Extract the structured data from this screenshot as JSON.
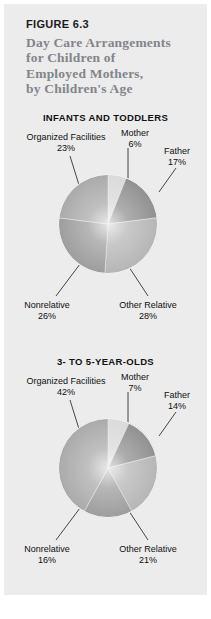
{
  "figure": {
    "number": "FIGURE 6.3",
    "title_lines": [
      "Day Care Arrangements",
      "for Children of",
      "Employed Mothers,",
      "by Children's Age"
    ],
    "title_color": "#82858a",
    "number_color": "#1b1b1b",
    "panel_color": "#ececed"
  },
  "chart_data": [
    {
      "type": "pie",
      "title": "INFANTS AND TODDLERS",
      "categories": [
        "Mother",
        "Father",
        "Other Relative",
        "Nonrelative",
        "Organized Facilities"
      ],
      "values": [
        6,
        17,
        28,
        26,
        23
      ],
      "labels": [
        "6%",
        "17%",
        "28%",
        "26%",
        "23%"
      ],
      "slice_colors": [
        "#d9d9d9",
        "#8e8e8e",
        "#b4b4b4",
        "#9b9b9b",
        "#a8a8a8"
      ],
      "start_angle": 0,
      "direction": "clockwise",
      "legend": "none",
      "grid": false
    },
    {
      "type": "pie",
      "title": "3- TO 5-YEAR-OLDS",
      "categories": [
        "Mother",
        "Father",
        "Other Relative",
        "Nonrelative",
        "Organized Facilities"
      ],
      "values": [
        7,
        14,
        21,
        16,
        42
      ],
      "labels": [
        "7%",
        "14%",
        "21%",
        "16%",
        "42%"
      ],
      "slice_colors": [
        "#d9d9d9",
        "#8e8e8e",
        "#b4b4b4",
        "#9b9b9b",
        "#a8a8a8"
      ],
      "start_angle": 0,
      "direction": "clockwise",
      "legend": "none",
      "grid": false
    }
  ]
}
